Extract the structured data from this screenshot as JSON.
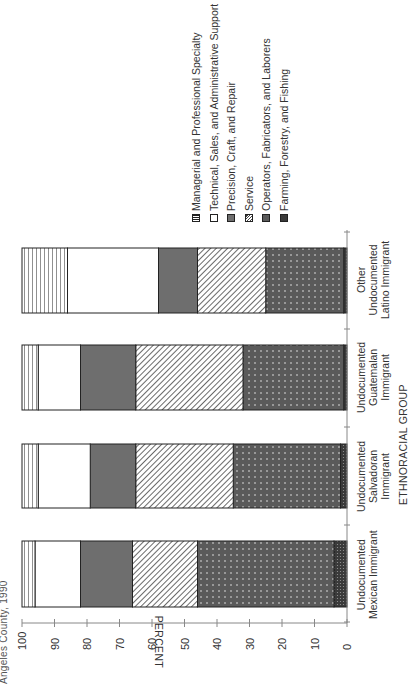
{
  "title_fragment": "Angeles County, 1990",
  "chart_data": {
    "type": "bar",
    "stacked": true,
    "orientation": "rotated-90",
    "title": "Angeles County, 1990",
    "xlabel": "ETHNORACIAL GROUP",
    "ylabel": "PERCENT",
    "ylim": [
      0,
      100
    ],
    "yticks": [
      0,
      10,
      20,
      30,
      40,
      50,
      60,
      70,
      80,
      90,
      100
    ],
    "categories": [
      "Undocumented Mexican Immigrant",
      "Undocumented Salvadoran Immigrant",
      "Undocumented Guatemalan Immigrant",
      "Other Undocumented Latino Immigrant"
    ],
    "series": [
      {
        "name": "Farming, Forestry, and Fishing",
        "pattern": "dense-dots",
        "values": [
          4,
          2,
          1,
          1
        ]
      },
      {
        "name": "Operators, Fabricators, and Laborers",
        "pattern": "dark-dotted",
        "values": [
          42,
          33,
          31,
          24
        ]
      },
      {
        "name": "Service",
        "pattern": "diagonal-hatch",
        "values": [
          20,
          30,
          33,
          21
        ]
      },
      {
        "name": "Precision, Craft, and Repair",
        "pattern": "solid-gray",
        "values": [
          16,
          14,
          17,
          12
        ]
      },
      {
        "name": "Technical, Sales, and Administrative Support",
        "pattern": "white",
        "values": [
          14,
          16,
          13,
          28
        ]
      },
      {
        "name": "Managerial and Professional Specialty",
        "pattern": "horizontal-lines",
        "values": [
          4,
          5,
          5,
          14
        ]
      }
    ],
    "legend": [
      "Managerial and Professional Specialty",
      "Technical, Sales, and Administrative Support",
      "Precision, Craft, and Repair",
      "Service",
      "Operators, Fabricators, and Laborers",
      "Farming, Forestry, and Fishing"
    ],
    "legend_position": "upper-right",
    "grid": false
  },
  "axis": {
    "percent_title": "PERCENT",
    "group_title": "ETHNORACIAL GROUP",
    "ticks": [
      "0",
      "10",
      "20",
      "30",
      "40",
      "50",
      "60",
      "70",
      "80",
      "90",
      "100"
    ]
  },
  "categories": [
    {
      "lines": [
        "Undocumented",
        "Mexican Immigrant"
      ]
    },
    {
      "lines": [
        "Undocumented",
        "Salvadoran",
        "Immigrant"
      ]
    },
    {
      "lines": [
        "Undocumented",
        "Guatemalan",
        "Immigrant"
      ]
    },
    {
      "lines": [
        "Other",
        "Undocumented",
        "Latino Immigrant"
      ]
    }
  ],
  "legend": [
    {
      "label": "Managerial and Professional Specialty",
      "swatch": "hlines"
    },
    {
      "label": "Technical, Sales, and Administrative Support",
      "swatch": "white"
    },
    {
      "label": "Precision, Craft, and Repair",
      "swatch": "gray"
    },
    {
      "label": "Service",
      "swatch": "diag"
    },
    {
      "label": "Operators, Fabricators, and Laborers",
      "swatch": "dotted"
    },
    {
      "label": "Farming, Forestry, and Fishing",
      "swatch": "dense"
    }
  ],
  "colors": {
    "axis": "#888888",
    "outline": "#222222",
    "gray": "#6e6e6e",
    "dotted_bg": "#5a5a5a",
    "dense_bg": "#3a3a3a"
  }
}
